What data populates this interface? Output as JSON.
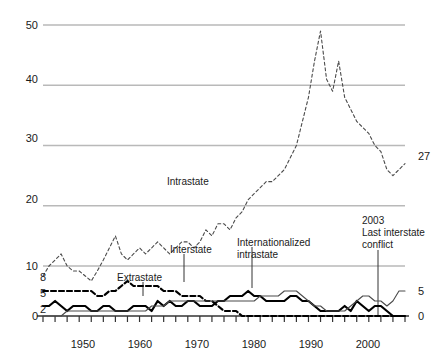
{
  "chart_data": {
    "type": "line",
    "title": "",
    "subtitle": "",
    "xlabel": "",
    "ylabel": "",
    "xlim": [
      1946,
      2006
    ],
    "ylim": [
      0,
      50
    ],
    "grid": true,
    "legend_position": "inline-annotations",
    "y_ticks": [
      0,
      2,
      5,
      8,
      10,
      20,
      30,
      40,
      50
    ],
    "y_gridline_ticks": [
      10,
      20,
      30,
      40,
      50
    ],
    "y_minor_ticks": [
      2,
      5,
      8
    ],
    "x_ticks": [
      1950,
      1960,
      1970,
      1980,
      1990,
      2000
    ],
    "x_tick_labels": [
      "1950",
      "1960",
      "1970",
      "1980",
      "1990",
      "2000"
    ],
    "x_minor_tick_interval": 2,
    "x": [
      1946,
      1947,
      1948,
      1949,
      1950,
      1951,
      1952,
      1953,
      1954,
      1955,
      1956,
      1957,
      1958,
      1959,
      1960,
      1961,
      1962,
      1963,
      1964,
      1965,
      1966,
      1967,
      1968,
      1969,
      1970,
      1971,
      1972,
      1973,
      1974,
      1975,
      1976,
      1977,
      1978,
      1979,
      1980,
      1981,
      1982,
      1983,
      1984,
      1985,
      1986,
      1987,
      1988,
      1989,
      1990,
      1991,
      1992,
      1993,
      1994,
      1995,
      1996,
      1997,
      1998,
      1999,
      2000,
      2001,
      2002,
      2003,
      2004,
      2005,
      2006
    ],
    "series": [
      {
        "name": "Intrastate",
        "style": "dashed-thin",
        "color": "#4a4a4a",
        "end_value": 27,
        "values": [
          8,
          10,
          11,
          12,
          10,
          9,
          9,
          8,
          7,
          9,
          11,
          13,
          15,
          12,
          11,
          12,
          13,
          12,
          13,
          14,
          13,
          12,
          13,
          14,
          14,
          13,
          14,
          16,
          15,
          17,
          17,
          16,
          18,
          19,
          21,
          22,
          23,
          24,
          24,
          25,
          26,
          28,
          30,
          34,
          38,
          44,
          49,
          41,
          39,
          44,
          38,
          36,
          34,
          33,
          32,
          30,
          29,
          26,
          25,
          26,
          27
        ]
      },
      {
        "name": "Extrastate",
        "style": "dashed-bold",
        "color": "#000000",
        "end_value": 0,
        "values": [
          5,
          5,
          5,
          5,
          5,
          5,
          5,
          5,
          5,
          4,
          4,
          5,
          5,
          6,
          7,
          6,
          6,
          6,
          6,
          6,
          5,
          5,
          5,
          4,
          4,
          4,
          4,
          3,
          3,
          2,
          1,
          1,
          1,
          0,
          0,
          0,
          0,
          0,
          0,
          0,
          0,
          0,
          0,
          0,
          0,
          0,
          0,
          0,
          0,
          0,
          0,
          0,
          0,
          0,
          0,
          0,
          0,
          0,
          0,
          0,
          0
        ]
      },
      {
        "name": "Interstate",
        "style": "solid-bold",
        "color": "#000000",
        "end_value": 0,
        "values": [
          2,
          2,
          3,
          2,
          1,
          2,
          2,
          2,
          1,
          1,
          2,
          2,
          1,
          1,
          1,
          2,
          2,
          2,
          1,
          3,
          2,
          3,
          2,
          2,
          3,
          3,
          2,
          2,
          2,
          3,
          3,
          4,
          4,
          4,
          5,
          4,
          4,
          3,
          3,
          3,
          3,
          4,
          4,
          3,
          3,
          2,
          1,
          1,
          1,
          1,
          2,
          1,
          3,
          2,
          1,
          2,
          2,
          1,
          0,
          0,
          0
        ]
      },
      {
        "name": "Internationalized intrastate",
        "style": "solid-thin",
        "color": "#4a4a4a",
        "end_value": 5,
        "values": [
          0,
          0,
          0,
          0,
          1,
          1,
          1,
          1,
          1,
          1,
          1,
          1,
          1,
          1,
          1,
          1,
          1,
          1,
          2,
          2,
          2,
          3,
          3,
          3,
          3,
          3,
          3,
          3,
          3,
          3,
          3,
          3,
          3,
          3,
          3,
          3,
          4,
          4,
          4,
          4,
          5,
          5,
          5,
          4,
          3,
          2,
          2,
          1,
          1,
          1,
          1,
          2,
          3,
          4,
          4,
          3,
          3,
          2,
          3,
          5,
          5
        ]
      }
    ],
    "annotations": [
      {
        "id": "intrastate-label",
        "text": "Intrastate"
      },
      {
        "id": "extrastate-label",
        "text": "Extrastate"
      },
      {
        "id": "interstate-label",
        "text": "Interstate"
      },
      {
        "id": "internationalized-label-line1",
        "text": "Internationalized"
      },
      {
        "id": "internationalized-label-line2",
        "text": "intrastate"
      },
      {
        "id": "event-year",
        "text": "2003"
      },
      {
        "id": "event-line1",
        "text": "Last interstate"
      },
      {
        "id": "event-line2",
        "text": "conflict"
      }
    ],
    "end_labels": [
      {
        "series": "Intrastate",
        "text": "27"
      },
      {
        "series": "Internationalized intrastate",
        "text": "5"
      },
      {
        "series": "Interstate",
        "text": "0"
      }
    ]
  },
  "axis": {
    "y_labels": [
      "50",
      "40",
      "30",
      "20",
      "10",
      "8",
      "5",
      "2",
      "0"
    ],
    "x_labels": [
      "1950",
      "1960",
      "1970",
      "1980",
      "1990",
      "2000"
    ]
  },
  "colors": {
    "grid": "#b9b9b9",
    "axis": "#333333",
    "bold_line": "#000000",
    "thin_line": "#4d4d4d",
    "text": "#1a1a1a",
    "background": "#ffffff"
  }
}
